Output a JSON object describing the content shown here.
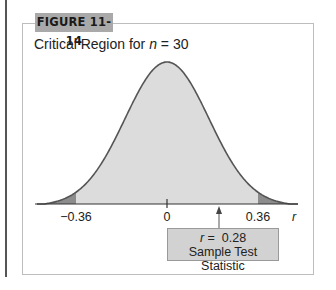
{
  "figure": {
    "tag": "FIGURE 11-14",
    "subtitle_prefix": "Critical Region for ",
    "subtitle_var": "n",
    "subtitle_suffix": " = 30"
  },
  "chart_data": {
    "type": "area",
    "title": "Critical Region for n = 30",
    "distribution": "bell-shaped (sampling distribution of r)",
    "xlabel": "r",
    "ylabel": "",
    "x_ticks": [
      {
        "value": -0.36,
        "label": "−0.36"
      },
      {
        "value": 0,
        "label": "0"
      },
      {
        "value": 0.36,
        "label": "0.36"
      }
    ],
    "critical_regions": [
      {
        "from": "-inf",
        "to": -0.36,
        "shade": "dark"
      },
      {
        "from": 0.36,
        "to": "inf",
        "shade": "dark"
      }
    ],
    "non_critical_region": {
      "from": -0.36,
      "to": 0.36,
      "shade": "light"
    },
    "annotation": {
      "x": 0.28,
      "text": "r = 0.28",
      "subtext": "Sample Test Statistic",
      "arrow": true
    },
    "grid": false,
    "legend": null,
    "colors": {
      "curve": "#555555",
      "light_fill": "#dcdcdc",
      "dark_fill": "#8c8c8c"
    }
  },
  "labels": {
    "neg_crit": "−0.36",
    "zero": "0",
    "pos_crit": "0.36",
    "axis_var": "r",
    "stat_var": "r",
    "stat_eq": " =  0.28",
    "stat_desc": "Sample Test Statistic"
  }
}
